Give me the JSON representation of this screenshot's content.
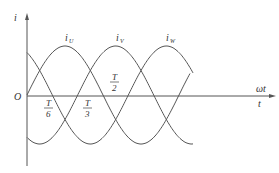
{
  "diagram": {
    "axes": {
      "y_label": "i",
      "x_label_top": "ωt",
      "x_label_bottom": "t",
      "origin_label": "O"
    },
    "curves": [
      {
        "name": "U",
        "label_main": "i",
        "label_sub": "U",
        "phase_deg": 0
      },
      {
        "name": "V",
        "label_main": "i",
        "label_sub": "V",
        "phase_deg": -120
      },
      {
        "name": "W",
        "label_main": "i",
        "label_sub": "W",
        "phase_deg": 120
      }
    ],
    "ticks": [
      {
        "num": "T",
        "den": "6"
      },
      {
        "num": "T",
        "den": "3"
      },
      {
        "num": "T",
        "den": "2"
      }
    ],
    "colors": {
      "stroke": "#555555",
      "text": "#333333"
    }
  }
}
